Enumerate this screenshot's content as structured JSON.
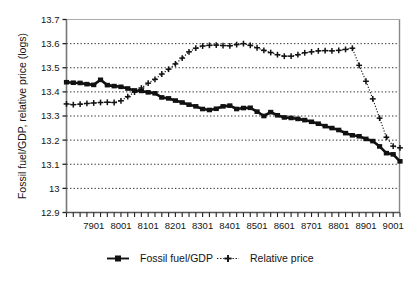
{
  "chart_data": {
    "type": "line",
    "title": "",
    "xlabel": "",
    "ylabel": "Fossil fuel/GDP, relative price (logs)",
    "ylim": [
      12.9,
      13.7
    ],
    "ytick_labels": [
      "13.7",
      "13.6",
      "13.5",
      "13.4",
      "13.3",
      "13.2",
      "13.1",
      "13",
      "12.9"
    ],
    "ytick_values": [
      13.7,
      13.6,
      13.5,
      13.4,
      13.3,
      13.2,
      13.1,
      13.0,
      12.9
    ],
    "xtick_labels": [
      "7901",
      "8001",
      "8101",
      "8201",
      "8301",
      "8401",
      "8501",
      "8601",
      "8701",
      "8801",
      "8901",
      "9001"
    ],
    "xtick_values": [
      1979.0,
      1980.0,
      1981.0,
      1982.0,
      1983.0,
      1984.0,
      1985.0,
      1986.0,
      1987.0,
      1988.0,
      1989.0,
      1990.0
    ],
    "xlim": [
      1978.0,
      1990.25
    ],
    "x_frequency": "quarterly",
    "grid": "horizontal-dotted",
    "legend_position": "bottom-center",
    "x": [
      1978.0,
      1978.25,
      1978.5,
      1978.75,
      1979.0,
      1979.25,
      1979.5,
      1979.75,
      1980.0,
      1980.25,
      1980.5,
      1980.75,
      1981.0,
      1981.25,
      1981.5,
      1981.75,
      1982.0,
      1982.25,
      1982.5,
      1982.75,
      1983.0,
      1983.25,
      1983.5,
      1983.75,
      1984.0,
      1984.25,
      1984.5,
      1984.75,
      1985.0,
      1985.25,
      1985.5,
      1985.75,
      1986.0,
      1986.25,
      1986.5,
      1986.75,
      1987.0,
      1987.25,
      1987.5,
      1987.75,
      1988.0,
      1988.25,
      1988.5,
      1988.75,
      1989.0,
      1989.25,
      1989.5,
      1989.75,
      1990.0,
      1990.25
    ],
    "series": [
      {
        "name": "Fossil fuel/GDP",
        "marker": "square",
        "line_style": "solid",
        "color": "#111111",
        "values": [
          13.44,
          13.438,
          13.437,
          13.432,
          13.429,
          13.45,
          13.428,
          13.424,
          13.421,
          13.414,
          13.406,
          13.404,
          13.398,
          13.394,
          13.377,
          13.373,
          13.364,
          13.356,
          13.347,
          13.34,
          13.329,
          13.325,
          13.33,
          13.34,
          13.343,
          13.329,
          13.333,
          13.334,
          13.318,
          13.3,
          13.316,
          13.303,
          13.294,
          13.292,
          13.288,
          13.283,
          13.276,
          13.268,
          13.258,
          13.25,
          13.242,
          13.229,
          13.22,
          13.216,
          13.205,
          13.196,
          13.174,
          13.146,
          13.141,
          13.112
        ]
      },
      {
        "name": "Relative price",
        "marker": "plus",
        "line_style": "dotted",
        "color": "#111111",
        "values": [
          13.35,
          13.347,
          13.349,
          13.352,
          13.354,
          13.356,
          13.357,
          13.356,
          13.363,
          13.38,
          13.399,
          13.416,
          13.436,
          13.452,
          13.474,
          13.494,
          13.516,
          13.54,
          13.566,
          13.581,
          13.59,
          13.593,
          13.594,
          13.592,
          13.591,
          13.596,
          13.6,
          13.593,
          13.583,
          13.572,
          13.563,
          13.554,
          13.548,
          13.548,
          13.554,
          13.562,
          13.566,
          13.57,
          13.571,
          13.57,
          13.572,
          13.576,
          13.581,
          13.51,
          13.444,
          13.371,
          13.291,
          13.212,
          13.175,
          13.168
        ]
      }
    ],
    "notes": [
      "Relative price drops sharply between 8502 and 8604",
      "Both series converge near 8801-8901"
    ]
  },
  "legend": {
    "items": [
      {
        "label": "Fossil fuel/GDP",
        "marker": "square",
        "style": "solid"
      },
      {
        "label": "Relative price",
        "marker": "plus",
        "style": "dotted"
      }
    ]
  },
  "tail_series": {
    "fossil_extra": {
      "x": [
        1990.5,
        1990.75,
        1991.0,
        1991.25,
        1991.5,
        1991.75,
        1992.0
      ],
      "values": [
        13.106,
        13.106,
        13.104,
        13.104,
        13.1,
        13.098,
        13.095
      ]
    },
    "price_extra": {
      "x": [
        1990.5,
        1990.75,
        1991.0,
        1991.25,
        1991.5,
        1991.75,
        1992.0
      ],
      "values": [
        13.031,
        13.06,
        13.028,
        13.036,
        13.035,
        13.018,
        13.003
      ]
    }
  }
}
